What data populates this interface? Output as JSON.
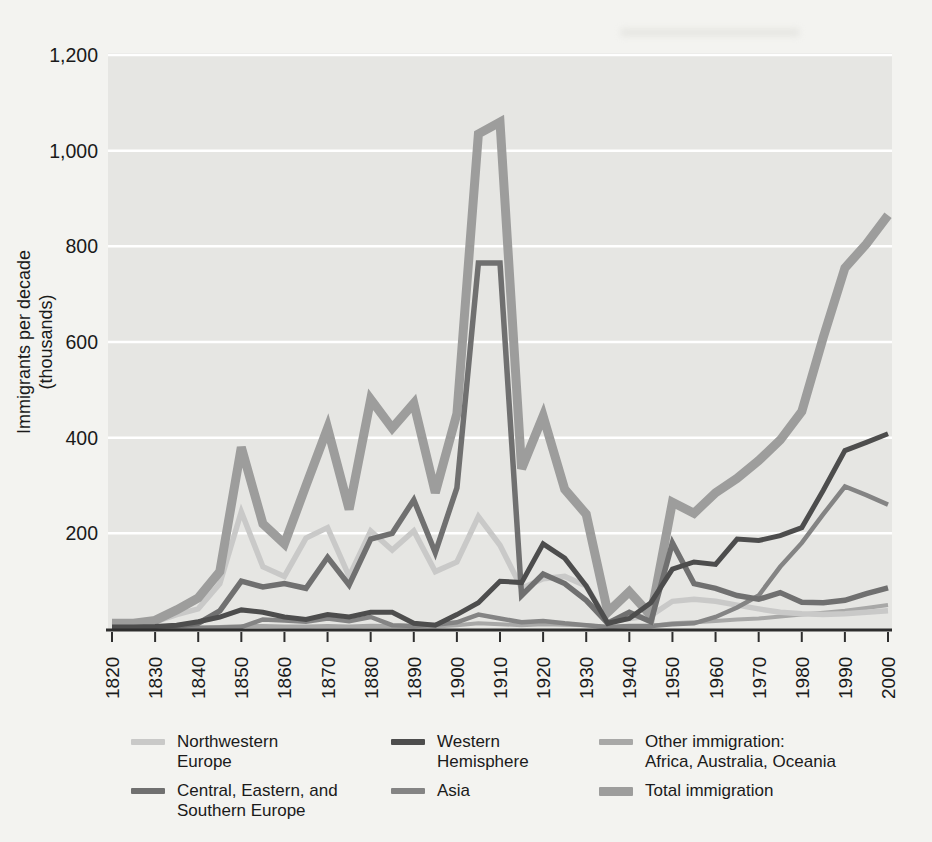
{
  "figure": {
    "y_axis_title_line1": "Immigrants per decade",
    "y_axis_title_line2": "(thousands)"
  },
  "chart_data": {
    "type": "line",
    "title": "",
    "xlabel": "",
    "ylabel": "Immigrants per decade (thousands)",
    "ylim": [
      0,
      1200
    ],
    "grid": "horizontal white gridlines on gray plot panel",
    "legend_position": "below chart, 3 columns x 2 rows",
    "x": [
      1820,
      1825,
      1830,
      1835,
      1840,
      1845,
      1850,
      1855,
      1860,
      1865,
      1870,
      1875,
      1880,
      1885,
      1890,
      1895,
      1900,
      1905,
      1910,
      1915,
      1920,
      1925,
      1930,
      1935,
      1940,
      1945,
      1950,
      1955,
      1960,
      1965,
      1970,
      1975,
      1980,
      1985,
      1990,
      1995,
      2000
    ],
    "x_tick_labels": [
      "1820",
      "1830",
      "1840",
      "1850",
      "1860",
      "1870",
      "1880",
      "1890",
      "1900",
      "1910",
      "1920",
      "1930",
      "1940",
      "1950",
      "1960",
      "1970",
      "1980",
      "1990",
      "2000"
    ],
    "y_tick_values": [
      200,
      400,
      600,
      800,
      1000,
      1200
    ],
    "y_tick_labels": [
      "200",
      "400",
      "600",
      "800",
      "1,000",
      "1,200"
    ],
    "series": [
      {
        "key": "nw",
        "name": "Northwestern Europe",
        "color": "#c9c9c8",
        "width": 5.5,
        "values": [
          8,
          10,
          15,
          30,
          42,
          95,
          245,
          130,
          110,
          190,
          212,
          110,
          205,
          165,
          205,
          120,
          140,
          235,
          175,
          85,
          105,
          110,
          90,
          15,
          22,
          28,
          58,
          62,
          58,
          50,
          42,
          35,
          32,
          30,
          32,
          35,
          38
        ]
      },
      {
        "key": "ces",
        "name": "Central, Eastern, and Southern Europe",
        "color": "#707070",
        "width": 5.5,
        "values": [
          2,
          2,
          3,
          6,
          12,
          38,
          100,
          88,
          95,
          85,
          150,
          92,
          188,
          200,
          270,
          160,
          295,
          765,
          765,
          70,
          115,
          95,
          60,
          12,
          35,
          15,
          180,
          95,
          85,
          70,
          62,
          76,
          56,
          55,
          60,
          74,
          86
        ]
      },
      {
        "key": "wh",
        "name": "Western Hemisphere",
        "color": "#4d4d4d",
        "width": 5,
        "values": [
          4,
          4,
          5,
          8,
          15,
          25,
          40,
          35,
          25,
          20,
          30,
          25,
          35,
          35,
          12,
          8,
          30,
          55,
          100,
          97,
          178,
          148,
          90,
          12,
          22,
          55,
          125,
          140,
          135,
          188,
          185,
          195,
          212,
          290,
          373,
          390,
          408
        ]
      },
      {
        "key": "asia",
        "name": "Asia",
        "color": "#848484",
        "width": 4.5,
        "values": [
          1,
          1,
          1,
          2,
          2,
          3,
          4,
          20,
          18,
          15,
          22,
          16,
          25,
          8,
          6,
          9,
          14,
          30,
          22,
          14,
          17,
          12,
          8,
          4,
          6,
          6,
          10,
          12,
          25,
          45,
          70,
          130,
          180,
          240,
          298,
          280,
          260
        ]
      },
      {
        "key": "other",
        "name": "Other immigration: Africa, Australia, Oceania",
        "color": "#a8a8a7",
        "width": 4,
        "values": [
          2,
          2,
          2,
          3,
          3,
          4,
          6,
          6,
          5,
          5,
          6,
          5,
          7,
          6,
          6,
          5,
          8,
          12,
          10,
          8,
          10,
          9,
          8,
          4,
          5,
          6,
          12,
          14,
          17,
          20,
          22,
          26,
          30,
          34,
          38,
          44,
          50
        ]
      },
      {
        "key": "total",
        "name": "Total immigration",
        "color": "#9d9d9c",
        "width": 9,
        "values": [
          12,
          12,
          18,
          40,
          65,
          120,
          380,
          220,
          178,
          300,
          420,
          250,
          480,
          420,
          472,
          285,
          450,
          1035,
          1060,
          335,
          445,
          292,
          240,
          35,
          78,
          28,
          265,
          242,
          285,
          315,
          352,
          395,
          455,
          610,
          755,
          805,
          865
        ]
      }
    ]
  },
  "legend": {
    "items": [
      {
        "key": "nw",
        "lines": [
          "Northwestern",
          "Europe"
        ],
        "color": "#c9c9c8",
        "thick": 6
      },
      {
        "key": "ces",
        "lines": [
          "Central, Eastern, and",
          "Southern Europe"
        ],
        "color": "#707070",
        "thick": 6
      },
      {
        "key": "wh",
        "lines": [
          "Western",
          "Hemisphere"
        ],
        "color": "#4d4d4d",
        "thick": 6
      },
      {
        "key": "asia",
        "lines": [
          "Asia"
        ],
        "color": "#848484",
        "thick": 6
      },
      {
        "key": "other",
        "lines": [
          "Other immigration:",
          "Africa, Australia, Oceania"
        ],
        "color": "#a8a8a7",
        "thick": 6
      },
      {
        "key": "total",
        "lines": [
          "Total immigration"
        ],
        "color": "#9d9d9c",
        "thick": 9
      }
    ]
  },
  "colors": {
    "page_bg": "#f3f3f0",
    "plot_bg": "#e6e6e3",
    "gridline": "#ffffff",
    "axis": "#2e2e2e",
    "text": "#1a1a1a"
  }
}
